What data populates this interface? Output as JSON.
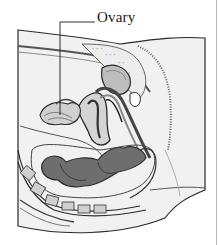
{
  "figure": {
    "labels": [
      {
        "text": "Ovary",
        "anchor_x": 97,
        "anchor_y": 22,
        "target_x": 60,
        "target_y": 115
      }
    ]
  },
  "colors": {
    "background": "#ffffff",
    "outline": "#2b2b2b",
    "tissue_light": "#e6e6e6",
    "tissue_mid": "#a9a9a9",
    "tissue_dark": "#5c5c5c",
    "edge_rule": "#b8b8b8"
  }
}
